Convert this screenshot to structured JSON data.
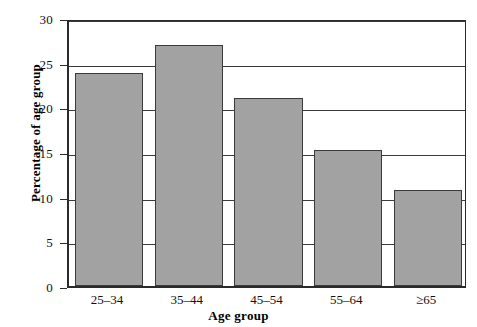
{
  "chart_data": {
    "type": "bar",
    "title": "",
    "subtitle": "",
    "xlabel": "Age group",
    "ylabel": "Percentage of age group",
    "categories": [
      "25–34",
      "35–44",
      "45–54",
      "55–64",
      "≥65"
    ],
    "values": [
      23.8,
      27.0,
      21.0,
      15.2,
      10.8
    ],
    "ylim": [
      0,
      30
    ],
    "yticks": [
      0,
      5,
      10,
      15,
      20,
      25,
      30
    ],
    "ytick_labels": [
      "0",
      "5",
      "10",
      "15",
      "20",
      "25",
      "30"
    ],
    "grid": true,
    "grid_axis": "y",
    "legend": false,
    "legend_position": "none",
    "bar_color": "#a2a2a2",
    "bar_edge_color": "#3b3b3b",
    "axis_color": "#2b2b2b",
    "background_color": "#ffffff",
    "series": [
      {
        "name": "Percentage of age group",
        "values": [
          23.8,
          27.0,
          21.0,
          15.2,
          10.8
        ]
      }
    ]
  },
  "axes": {
    "y_title": "Percentage of age group",
    "x_title": "Age group"
  }
}
